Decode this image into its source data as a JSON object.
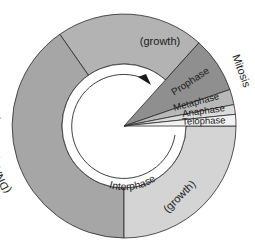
{
  "diagram": {
    "type": "cell-cycle-ring",
    "center": {
      "x": 124,
      "y": 126
    },
    "outer_radius": 112,
    "inner_radius": 62,
    "arrow_radius": 52,
    "segments": [
      {
        "id": "g1",
        "label": "(growth)",
        "start_deg": 48,
        "end_deg": 125,
        "color": "#b3b3b3"
      },
      {
        "id": "s",
        "label": "(DNA synthesis)",
        "start_deg": 125,
        "end_deg": 270,
        "color": "#a6a6a6"
      },
      {
        "id": "g2",
        "label": "(growth)",
        "start_deg": 270,
        "end_deg": 360,
        "color": "#d4d4d4"
      }
    ],
    "mitosis_wedges": [
      {
        "id": "prophase",
        "label": "Prophase",
        "start_deg": 19,
        "end_deg": 48,
        "color": "#8f8f8f"
      },
      {
        "id": "metaphase",
        "label": "Metaphase",
        "start_deg": 11,
        "end_deg": 19,
        "color": "#b8b8b8"
      },
      {
        "id": "anaphase",
        "label": "Anaphase",
        "start_deg": 6,
        "end_deg": 11,
        "color": "#dcdcdc"
      },
      {
        "id": "telophase",
        "label": "Telophase",
        "start_deg": 0,
        "end_deg": 6,
        "color": "#f2f2f2"
      }
    ],
    "labels": {
      "mitosis": "Mitosis",
      "interphase": "Interphase",
      "growth_top": "(growth)",
      "dna_synthesis": "(DNA synthesis)",
      "growth_bottom": "(growth)",
      "prophase": "Prophase",
      "metaphase": "Metaphase",
      "anaphase": "Anaphase",
      "telophase": "Telophase"
    },
    "colors": {
      "stroke": "#2a2a2a",
      "background": "#ffffff"
    }
  }
}
